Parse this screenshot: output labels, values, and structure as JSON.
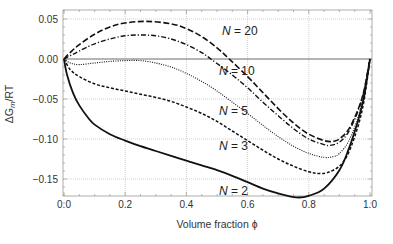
{
  "chart_data": {
    "type": "line",
    "title": "",
    "xlabel": "Volume fraction ϕ",
    "ylabel": "ΔG_m/RT",
    "xlim": [
      0.0,
      1.0
    ],
    "ylim": [
      -0.185,
      0.062
    ],
    "x_ticks": [
      "0.0",
      "0.2",
      "0.4",
      "0.6",
      "0.8",
      "1.0"
    ],
    "y_ticks": [
      "0.05",
      "0.00",
      "−0.05",
      "−0.10",
      "−0.15"
    ],
    "grid": true,
    "legend": "inline labels",
    "series": [
      {
        "name": "N = 20",
        "style": "long-dash",
        "x": [
          0.0,
          0.02,
          0.05,
          0.1,
          0.15,
          0.2,
          0.27,
          0.35,
          0.4,
          0.45,
          0.5,
          0.54,
          0.6,
          0.65,
          0.7,
          0.75,
          0.8,
          0.85,
          0.88,
          0.9,
          0.93,
          0.96,
          0.98,
          1.0
        ],
        "y": [
          0.0,
          0.008,
          0.018,
          0.031,
          0.04,
          0.045,
          0.047,
          0.044,
          0.038,
          0.028,
          0.014,
          0.0,
          -0.022,
          -0.042,
          -0.062,
          -0.08,
          -0.094,
          -0.102,
          -0.103,
          -0.1,
          -0.088,
          -0.064,
          -0.04,
          0.0
        ]
      },
      {
        "name": "N = 10",
        "style": "dash-dot",
        "x": [
          0.0,
          0.02,
          0.05,
          0.1,
          0.15,
          0.2,
          0.25,
          0.3,
          0.35,
          0.4,
          0.45,
          0.48,
          0.55,
          0.6,
          0.65,
          0.7,
          0.75,
          0.8,
          0.85,
          0.87,
          0.9,
          0.93,
          0.96,
          0.98,
          1.0
        ],
        "y": [
          0.0,
          0.004,
          0.01,
          0.019,
          0.025,
          0.029,
          0.03,
          0.029,
          0.025,
          0.018,
          0.008,
          0.0,
          -0.02,
          -0.036,
          -0.054,
          -0.071,
          -0.087,
          -0.1,
          -0.107,
          -0.108,
          -0.104,
          -0.091,
          -0.066,
          -0.041,
          0.0
        ]
      },
      {
        "name": "N = 5",
        "style": "dotted",
        "x": [
          0.0,
          0.02,
          0.05,
          0.1,
          0.15,
          0.2,
          0.25,
          0.3,
          0.35,
          0.4,
          0.45,
          0.5,
          0.55,
          0.6,
          0.65,
          0.7,
          0.75,
          0.8,
          0.85,
          0.88,
          0.9,
          0.93,
          0.96,
          0.98,
          1.0
        ],
        "y": [
          0.0,
          -0.005,
          -0.007,
          -0.005,
          -0.003,
          -0.002,
          -0.002,
          -0.005,
          -0.01,
          -0.018,
          -0.028,
          -0.04,
          -0.054,
          -0.068,
          -0.083,
          -0.097,
          -0.109,
          -0.118,
          -0.123,
          -0.122,
          -0.118,
          -0.103,
          -0.074,
          -0.046,
          0.0
        ]
      },
      {
        "name": "N = 3",
        "style": "short-dash",
        "x": [
          0.0,
          0.02,
          0.05,
          0.1,
          0.15,
          0.2,
          0.25,
          0.3,
          0.35,
          0.4,
          0.45,
          0.5,
          0.55,
          0.6,
          0.65,
          0.7,
          0.75,
          0.8,
          0.83,
          0.86,
          0.9,
          0.93,
          0.96,
          0.98,
          1.0
        ],
        "y": [
          0.0,
          -0.013,
          -0.022,
          -0.031,
          -0.036,
          -0.04,
          -0.044,
          -0.048,
          -0.053,
          -0.06,
          -0.068,
          -0.078,
          -0.09,
          -0.102,
          -0.114,
          -0.125,
          -0.134,
          -0.141,
          -0.143,
          -0.142,
          -0.134,
          -0.117,
          -0.085,
          -0.053,
          0.0
        ]
      },
      {
        "name": "N = 2",
        "style": "solid",
        "x": [
          0.0,
          0.01,
          0.03,
          0.05,
          0.08,
          0.1,
          0.15,
          0.2,
          0.25,
          0.3,
          0.35,
          0.4,
          0.45,
          0.5,
          0.55,
          0.6,
          0.65,
          0.7,
          0.76,
          0.8,
          0.85,
          0.9,
          0.93,
          0.96,
          0.98,
          1.0
        ],
        "y": [
          0.0,
          -0.02,
          -0.043,
          -0.058,
          -0.074,
          -0.082,
          -0.094,
          -0.102,
          -0.109,
          -0.115,
          -0.121,
          -0.127,
          -0.133,
          -0.139,
          -0.146,
          -0.154,
          -0.162,
          -0.168,
          -0.173,
          -0.171,
          -0.162,
          -0.139,
          -0.113,
          -0.078,
          -0.048,
          0.0
        ]
      }
    ],
    "annotations": [
      {
        "text": "N = 20",
        "x": 0.52,
        "y": 0.033
      },
      {
        "text": "N = 10",
        "x": 0.5,
        "y": -0.012
      },
      {
        "text": "N = 5",
        "x": 0.5,
        "y": -0.052
      },
      {
        "text": "N = 3",
        "x": 0.5,
        "y": -0.1
      },
      {
        "text": "N = 2",
        "x": 0.5,
        "y": -0.159
      }
    ]
  },
  "axes": {
    "x_label": "Volume fraction ϕ",
    "y_label": "ΔG",
    "y_label_sub": "m",
    "y_label_suffix": "/RT"
  },
  "labels": {
    "n20": "N",
    "n20_val": " = 20",
    "n10": "N",
    "n10_val": " = 10",
    "n5": "N",
    "n5_val": " = 5",
    "n3": "N",
    "n3_val": " = 3",
    "n2": "N",
    "n2_val": " = 2"
  },
  "colors": {
    "curve": "#111111",
    "grid": "#bbbbbb",
    "frame": "#999999",
    "zero_line": "#444444"
  }
}
